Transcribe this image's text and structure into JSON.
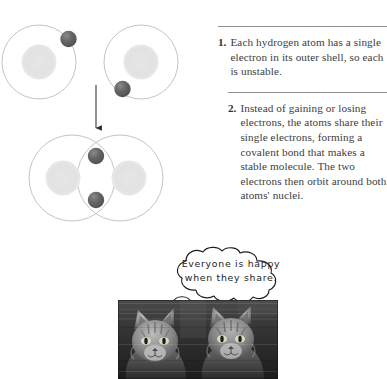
{
  "figure": {
    "steps": [
      {
        "number": "1.",
        "text": "Each hydrogen atom has a single electron in its outer shell, so each is unstable."
      },
      {
        "number": "2.",
        "text": "Instead of gaining or losing electrons, the atoms share their single electrons, forming a covalent bond that makes a stable molecule. The two electrons then orbit around both atoms' nuclei."
      }
    ],
    "diagram": {
      "separate_atoms_label": "two separate hydrogen atoms",
      "bonded_atoms_label": "hydrogen molecule with covalent bond",
      "arrow_label": "downward transition arrow"
    },
    "caption_bubble": {
      "line1": "Everyone is happy",
      "line2": "when they share."
    },
    "photo": {
      "alt": "two tabby cats sitting side by side"
    },
    "colors": {
      "orbit_stroke": "#b9b9b9",
      "nucleus_fill": "#e3e3e3",
      "electron_fill": "#595959",
      "rule": "#8e8e8e",
      "text": "#3d3d3d",
      "bubble_stroke": "#1d1d1d"
    }
  }
}
